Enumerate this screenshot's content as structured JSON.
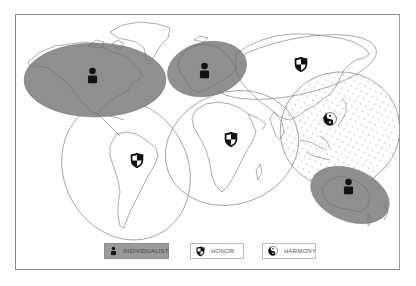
{
  "figure": {
    "legend": [
      {
        "id": "individualist",
        "label": "INDIVIDUALIST",
        "icon": "person-icon",
        "fill": "#9a9a9a"
      },
      {
        "id": "honor",
        "label": "HONOR",
        "icon": "shield-icon",
        "fill": "#ffffff"
      },
      {
        "id": "harmony",
        "label": "HARMONY",
        "icon": "yin-yang-icon",
        "fill": "#ffffff"
      }
    ],
    "regions": [
      {
        "name": "North America",
        "culture": "individualist"
      },
      {
        "name": "Western Europe",
        "culture": "individualist"
      },
      {
        "name": "Australia",
        "culture": "individualist"
      },
      {
        "name": "Latin America",
        "culture": "honor"
      },
      {
        "name": "Africa and Middle East",
        "culture": "honor"
      },
      {
        "name": "Russia and Central Asia",
        "culture": "honor"
      },
      {
        "name": "East Asia",
        "culture": "harmony"
      }
    ],
    "colors": {
      "individualist_fill": "#8f8f8f",
      "outline": "#9a9a9a",
      "icon": "#111111",
      "frame": "#8a8a8a"
    }
  }
}
